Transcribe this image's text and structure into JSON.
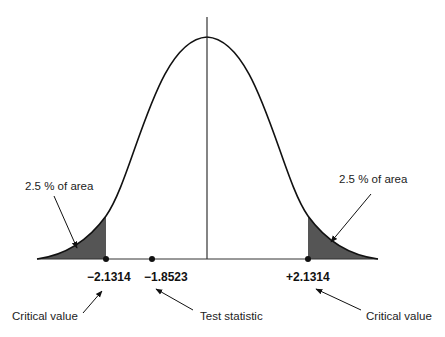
{
  "diagram": {
    "type": "two-tailed t-test normal curve",
    "shade_color": "#555555",
    "line_color": "#111111",
    "tail_labels": {
      "left": "2.5 % of area",
      "right": "2.5 % of area"
    },
    "values": {
      "left_critical": "−2.1314",
      "test_statistic": "−1.8523",
      "right_critical": "+2.1314"
    },
    "callouts": {
      "left_critical": "Critical value",
      "test_statistic": "Test statistic",
      "right_critical": "Critical value"
    }
  }
}
